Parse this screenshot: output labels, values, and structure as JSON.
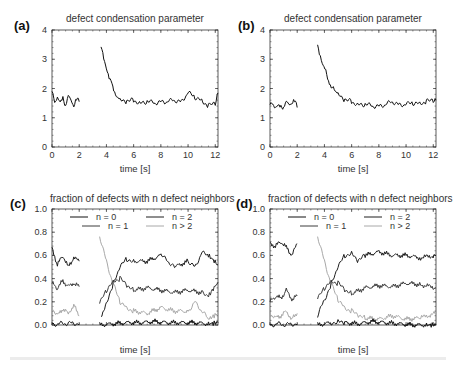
{
  "chart_data": [
    {
      "panel": "(a)",
      "type": "line",
      "title": "defect condensation parameter",
      "xlabel": "time [s]",
      "ylabel": "",
      "xlim": [
        0,
        12.2
      ],
      "ylim": [
        0,
        4
      ],
      "xticks": [
        "0",
        "2",
        "4",
        "6",
        "8",
        "10",
        "12"
      ],
      "yticks": [
        "0",
        "1",
        "2",
        "3",
        "4"
      ],
      "grid": false,
      "series": [
        {
          "name": "condensation",
          "color": "#111111",
          "segments": [
            {
              "x": [
                0,
                0.2,
                0.4,
                0.6,
                0.8,
                1.0,
                1.2,
                1.4,
                1.6,
                1.8,
                2.0
              ],
              "y": [
                1.9,
                1.45,
                1.7,
                1.5,
                1.65,
                1.45,
                1.8,
                1.6,
                1.45,
                1.65,
                1.55
              ]
            },
            {
              "x": [
                3.6,
                3.8,
                4.0,
                4.2,
                4.4,
                4.6,
                4.8,
                5.0,
                5.5,
                6.0,
                6.5,
                7.0,
                7.5,
                8.0,
                8.5,
                9.0,
                9.5,
                10.0,
                10.5,
                11.0,
                11.5,
                12.0,
                12.2
              ],
              "y": [
                3.5,
                3.0,
                2.7,
                2.35,
                2.1,
                1.85,
                1.7,
                1.6,
                1.55,
                1.6,
                1.5,
                1.55,
                1.5,
                1.55,
                1.55,
                1.6,
                1.55,
                1.85,
                1.7,
                1.6,
                1.4,
                1.5,
                1.85
              ]
            }
          ]
        }
      ]
    },
    {
      "panel": "(b)",
      "type": "line",
      "title": "defect condensation parameter",
      "xlabel": "time [s]",
      "ylabel": "",
      "xlim": [
        0,
        12.2
      ],
      "ylim": [
        0,
        4
      ],
      "xticks": [
        "0",
        "2",
        "4",
        "6",
        "8",
        "10",
        "12"
      ],
      "yticks": [
        "0",
        "1",
        "2",
        "3",
        "4"
      ],
      "grid": false,
      "series": [
        {
          "name": "condensation",
          "color": "#111111",
          "segments": [
            {
              "x": [
                0,
                0.2,
                0.4,
                0.6,
                0.8,
                1.0,
                1.2,
                1.4,
                1.6,
                1.8,
                2.0
              ],
              "y": [
                1.45,
                1.4,
                1.35,
                1.4,
                1.35,
                1.4,
                1.6,
                1.45,
                1.55,
                1.6,
                1.35
              ]
            },
            {
              "x": [
                3.5,
                3.7,
                3.9,
                4.1,
                4.3,
                4.5,
                4.8,
                5.0,
                5.5,
                6.0,
                6.5,
                7.0,
                7.5,
                8.0,
                8.5,
                9.0,
                9.5,
                10.0,
                10.5,
                11.0,
                11.5,
                12.0,
                12.2
              ],
              "y": [
                3.4,
                3.1,
                2.8,
                2.6,
                2.3,
                2.1,
                1.9,
                1.8,
                1.6,
                1.55,
                1.45,
                1.45,
                1.4,
                1.4,
                1.45,
                1.55,
                1.45,
                1.45,
                1.5,
                1.5,
                1.55,
                1.6,
                1.6
              ]
            }
          ]
        }
      ]
    },
    {
      "panel": "(c)",
      "type": "line",
      "title": "fraction of defects with n defect neighbors",
      "xlabel": "time [s]",
      "ylabel": "",
      "xlim": [
        0,
        12.2
      ],
      "ylim": [
        0,
        1.0
      ],
      "xticks": [
        "0",
        "2",
        "4",
        "6",
        "8",
        "10",
        "12"
      ],
      "yticks": [
        "0.0",
        "0.2",
        "0.4",
        "0.6",
        "0.8",
        "1.0"
      ],
      "grid": false,
      "legend": {
        "position": "upper center",
        "columns": 2
      },
      "series": [
        {
          "name": "n = 0",
          "color": "#111111",
          "segments": [
            {
              "x": [
                0,
                0.5,
                1.0,
                1.5,
                2.0
              ],
              "y": [
                0.01,
                0.01,
                0.01,
                0.02,
                0.01
              ]
            },
            {
              "x": [
                3.5,
                4.5,
                5.5,
                6.5,
                7.5,
                8.5,
                9.5,
                10.5,
                11.5,
                12.2
              ],
              "y": [
                0.0,
                0.01,
                0.02,
                0.02,
                0.03,
                0.02,
                0.02,
                0.02,
                0.01,
                0.02
              ]
            }
          ]
        },
        {
          "name": "n = 1",
          "color": "#3c3c3c",
          "segments": [
            {
              "x": [
                0,
                0.4,
                0.8,
                1.2,
                1.6,
                2.0
              ],
              "y": [
                0.36,
                0.32,
                0.38,
                0.33,
                0.36,
                0.33
              ]
            },
            {
              "x": [
                3.5,
                4.0,
                4.5,
                5.0,
                5.5,
                6.0,
                7.0,
                8.0,
                9.0,
                10.0,
                11.0,
                11.5,
                12.2
              ],
              "y": [
                0.18,
                0.3,
                0.38,
                0.4,
                0.34,
                0.3,
                0.32,
                0.3,
                0.28,
                0.3,
                0.28,
                0.25,
                0.37
              ]
            }
          ]
        },
        {
          "name": "n = 2",
          "color": "#1e1e1e",
          "segments": [
            {
              "x": [
                0,
                0.4,
                0.8,
                1.2,
                1.6,
                2.0
              ],
              "y": [
                0.66,
                0.52,
                0.6,
                0.5,
                0.58,
                0.55
              ]
            },
            {
              "x": [
                3.6,
                4.0,
                4.5,
                5.0,
                5.5,
                6.0,
                7.0,
                8.0,
                8.5,
                9.0,
                10.0,
                10.5,
                11.0,
                11.5,
                12.2
              ],
              "y": [
                0.05,
                0.2,
                0.35,
                0.5,
                0.57,
                0.55,
                0.55,
                0.6,
                0.55,
                0.5,
                0.55,
                0.5,
                0.62,
                0.6,
                0.52
              ]
            }
          ]
        },
        {
          "name": "n > 2",
          "color": "#a8a8a8",
          "segments": [
            {
              "x": [
                0,
                0.4,
                0.8,
                1.2,
                1.6,
                2.0
              ],
              "y": [
                0.15,
                0.08,
                0.14,
                0.1,
                0.17,
                0.08
              ]
            },
            {
              "x": [
                3.5,
                4.0,
                4.5,
                5.0,
                5.5,
                6.0,
                7.0,
                8.0,
                9.0,
                10.0,
                10.5,
                11.0,
                11.5,
                12.2
              ],
              "y": [
                0.77,
                0.55,
                0.35,
                0.2,
                0.15,
                0.12,
                0.1,
                0.15,
                0.12,
                0.12,
                0.2,
                0.12,
                0.05,
                0.1
              ]
            }
          ]
        }
      ]
    },
    {
      "panel": "(d)",
      "type": "line",
      "title": "fraction of defects with n defect neighbors",
      "xlabel": "time [s]",
      "ylabel": "",
      "xlim": [
        0,
        12.2
      ],
      "ylim": [
        0,
        1.0
      ],
      "xticks": [
        "0",
        "2",
        "4",
        "6",
        "8",
        "10",
        "12"
      ],
      "yticks": [
        "0.0",
        "0.2",
        "0.4",
        "0.6",
        "0.8",
        "1.0"
      ],
      "grid": false,
      "legend": {
        "position": "upper center",
        "columns": 2
      },
      "series": [
        {
          "name": "n = 0",
          "color": "#111111",
          "segments": [
            {
              "x": [
                0,
                0.5,
                1.0,
                1.5,
                2.0
              ],
              "y": [
                0.0,
                0.01,
                0.0,
                0.01,
                0.01
              ]
            },
            {
              "x": [
                3.5,
                4.5,
                5.0,
                5.5,
                6.5,
                7.5,
                8.5,
                9.5,
                10.5,
                11.5,
                12.2
              ],
              "y": [
                0.0,
                0.02,
                0.03,
                0.02,
                0.01,
                0.03,
                0.02,
                0.01,
                0.0,
                0.0,
                0.0
              ]
            }
          ]
        },
        {
          "name": "n = 1",
          "color": "#3c3c3c",
          "segments": [
            {
              "x": [
                0,
                0.4,
                0.8,
                1.2,
                1.6,
                2.0
              ],
              "y": [
                0.2,
                0.25,
                0.23,
                0.3,
                0.22,
                0.25
              ]
            },
            {
              "x": [
                3.5,
                4.0,
                4.5,
                5.0,
                5.5,
                6.0,
                7.0,
                8.0,
                9.0,
                10.0,
                11.0,
                12.2
              ],
              "y": [
                0.22,
                0.32,
                0.38,
                0.36,
                0.3,
                0.27,
                0.32,
                0.34,
                0.33,
                0.36,
                0.35,
                0.32
              ]
            }
          ]
        },
        {
          "name": "n = 2",
          "color": "#1e1e1e",
          "segments": [
            {
              "x": [
                0,
                0.4,
                0.8,
                1.2,
                1.6,
                2.0
              ],
              "y": [
                0.7,
                0.68,
                0.72,
                0.67,
                0.6,
                0.7
              ]
            },
            {
              "x": [
                3.5,
                4.0,
                4.5,
                5.0,
                5.5,
                6.0,
                6.5,
                7.0,
                8.0,
                9.0,
                10.0,
                11.0,
                12.2
              ],
              "y": [
                0.08,
                0.22,
                0.35,
                0.5,
                0.6,
                0.62,
                0.55,
                0.6,
                0.63,
                0.6,
                0.6,
                0.58,
                0.6
              ]
            }
          ]
        },
        {
          "name": "n > 2",
          "color": "#a8a8a8",
          "segments": [
            {
              "x": [
                0,
                0.4,
                0.8,
                1.2,
                1.6,
                2.0
              ],
              "y": [
                0.1,
                0.06,
                0.08,
                0.12,
                0.05,
                0.1
              ]
            },
            {
              "x": [
                3.5,
                4.0,
                4.5,
                5.0,
                5.5,
                6.0,
                6.5,
                7.0,
                8.0,
                9.0,
                10.0,
                11.0,
                12.2
              ],
              "y": [
                0.77,
                0.55,
                0.35,
                0.22,
                0.15,
                0.12,
                0.08,
                0.06,
                0.05,
                0.08,
                0.05,
                0.06,
                0.1
              ]
            }
          ]
        }
      ]
    }
  ],
  "panels": {
    "a": {
      "label": "(a)",
      "title": "defect condensation parameter",
      "xlabel": "time [s]"
    },
    "b": {
      "label": "(b)",
      "title": "defect condensation parameter",
      "xlabel": "time [s]"
    },
    "c": {
      "label": "(c)",
      "title": "fraction of defects with n defect neighbors",
      "xlabel": "time [s]"
    },
    "d": {
      "label": "(d)",
      "title": "fraction of defects with n defect neighbors",
      "xlabel": "time [s]"
    }
  },
  "legend": {
    "items": [
      {
        "label": "n = 0",
        "color": "#111111"
      },
      {
        "label": "n = 1",
        "color": "#3c3c3c"
      },
      {
        "label": "n = 2",
        "color": "#1e1e1e"
      },
      {
        "label": "n > 2",
        "color": "#a8a8a8"
      }
    ]
  }
}
